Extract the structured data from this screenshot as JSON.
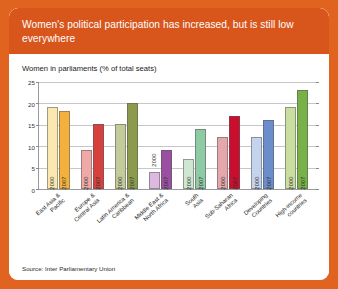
{
  "header": {
    "title": "Women's political participation has increased, but is still low everywhere"
  },
  "subtitle": "Women in parliaments (% of total seats)",
  "source": "Source: Inter Parliamentary Union",
  "colors": {
    "card_border": "#e0631f",
    "header_bg": "#d8551c",
    "header_text": "#ffffff",
    "card_bg": "#ffffff",
    "gridline": "#c6c6c6",
    "axis": "#9a9a9a"
  },
  "chart_data": {
    "type": "bar",
    "title": "Women in parliaments (% of total seats)",
    "xlabel": "",
    "ylabel": "",
    "ylim": [
      0,
      25
    ],
    "yticks": [
      0,
      5,
      10,
      15,
      20,
      25
    ],
    "grid": true,
    "legend": "none",
    "categories": [
      "East Asia & Pacific",
      "Europe & Central Asia",
      "Latin America & Caribbean",
      "Middle East & North Africa",
      "South Asia",
      "Sub-Saharan Africa",
      "Developing Countries",
      "High-income countries"
    ],
    "series": [
      {
        "name": "2000",
        "values": [
          19,
          9,
          15,
          4,
          7,
          12,
          12,
          19
        ]
      },
      {
        "name": "2007",
        "values": [
          18,
          15,
          20,
          9,
          14,
          17,
          16,
          23
        ]
      }
    ],
    "bar_colors": [
      {
        "c2000": "#fae8b0",
        "c2007": "#f3b13c"
      },
      {
        "c2000": "#efa9a6",
        "c2007": "#d5423e"
      },
      {
        "c2000": "#c3cb9a",
        "c2007": "#8b9b4b"
      },
      {
        "c2000": "#ddb8e0",
        "c2007": "#9b4fa0"
      },
      {
        "c2000": "#cfe6d2",
        "c2007": "#8ecaa4"
      },
      {
        "c2000": "#e4a7ab",
        "c2007": "#c8102e"
      },
      {
        "c2000": "#c6d3ec",
        "c2007": "#6b8dcb"
      },
      {
        "c2000": "#c8dfa0",
        "c2007": "#77b148"
      }
    ]
  }
}
